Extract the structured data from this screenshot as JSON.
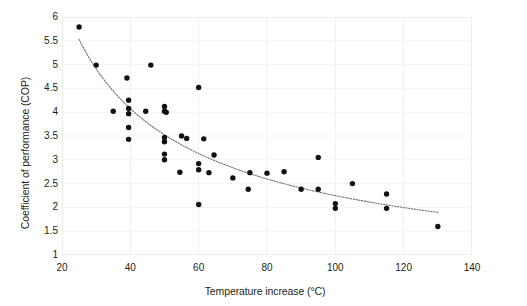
{
  "chart_data": {
    "type": "scatter",
    "title": "",
    "xlabel": "Temperature increase (°C)",
    "ylabel": "Coefficient of performance (COP)",
    "xlim": [
      20,
      140
    ],
    "ylim": [
      1,
      6
    ],
    "xticks": [
      20,
      40,
      60,
      80,
      100,
      120,
      140
    ],
    "yticks": [
      1,
      1.5,
      2,
      2.5,
      3,
      3.5,
      4,
      4.5,
      5,
      5.5,
      6
    ],
    "grid": true,
    "legend": "none",
    "marker_color": "#111111",
    "trendline_color": "#6f6f6f",
    "trendline_style": "dotted",
    "trendline_label": "fitted decay trend",
    "points": [
      {
        "x": 25,
        "y": 5.79
      },
      {
        "x": 30,
        "y": 4.99
      },
      {
        "x": 39,
        "y": 4.72
      },
      {
        "x": 46,
        "y": 4.99
      },
      {
        "x": 39.5,
        "y": 4.25
      },
      {
        "x": 60,
        "y": 4.52
      },
      {
        "x": 39.5,
        "y": 4.08
      },
      {
        "x": 35,
        "y": 4.02
      },
      {
        "x": 39.5,
        "y": 3.97
      },
      {
        "x": 44.5,
        "y": 4.02
      },
      {
        "x": 50,
        "y": 4.12
      },
      {
        "x": 50,
        "y": 4.02
      },
      {
        "x": 50.5,
        "y": 4.0
      },
      {
        "x": 39.5,
        "y": 3.68
      },
      {
        "x": 39.5,
        "y": 3.43
      },
      {
        "x": 50,
        "y": 3.47
      },
      {
        "x": 50,
        "y": 3.38
      },
      {
        "x": 55,
        "y": 3.5
      },
      {
        "x": 56.5,
        "y": 3.45
      },
      {
        "x": 61.5,
        "y": 3.44
      },
      {
        "x": 50,
        "y": 3.12
      },
      {
        "x": 50,
        "y": 3.0
      },
      {
        "x": 64.5,
        "y": 3.1
      },
      {
        "x": 60,
        "y": 2.92
      },
      {
        "x": 60,
        "y": 2.79
      },
      {
        "x": 54.5,
        "y": 2.74
      },
      {
        "x": 63,
        "y": 2.73
      },
      {
        "x": 75,
        "y": 2.73
      },
      {
        "x": 70,
        "y": 2.62
      },
      {
        "x": 80,
        "y": 2.72
      },
      {
        "x": 74.5,
        "y": 2.38
      },
      {
        "x": 60,
        "y": 2.06
      },
      {
        "x": 85,
        "y": 2.75
      },
      {
        "x": 90,
        "y": 2.38
      },
      {
        "x": 95,
        "y": 3.05
      },
      {
        "x": 95,
        "y": 2.38
      },
      {
        "x": 105,
        "y": 2.5
      },
      {
        "x": 100,
        "y": 2.08
      },
      {
        "x": 115,
        "y": 2.28
      },
      {
        "x": 100,
        "y": 1.98
      },
      {
        "x": 115,
        "y": 1.98
      },
      {
        "x": 130,
        "y": 1.6
      }
    ]
  },
  "axes": {
    "ylabel": "Coefficient of performance (COP)",
    "xlabel": "Temperature increase (°C)",
    "ytick_labels": [
      "6",
      "5.5",
      "5",
      "4.5",
      "4",
      "3.5",
      "3",
      "2.5",
      "2",
      "1.5",
      "1"
    ],
    "xtick_labels": [
      "20",
      "40",
      "60",
      "80",
      "100",
      "120",
      "140"
    ]
  }
}
